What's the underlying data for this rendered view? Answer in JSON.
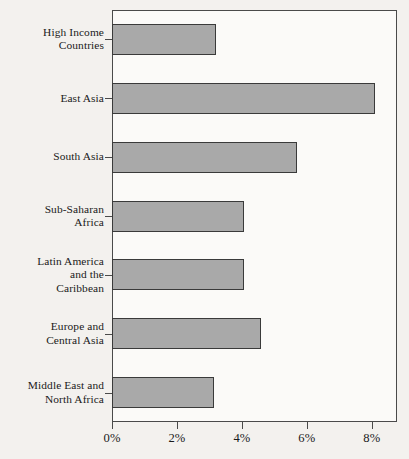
{
  "chart_data": {
    "type": "bar",
    "orientation": "horizontal",
    "title": "",
    "subtitle": "",
    "xlabel": "",
    "ylabel": "",
    "categories": [
      "High Income\nCountries",
      "East Asia",
      "South Asia",
      "Sub-Saharan\nAfrica",
      "Latin America\nand the\nCaribbean",
      "Europe and\nCentral Asia",
      "Middle East and\nNorth Africa"
    ],
    "values": [
      3.2,
      8.1,
      5.7,
      4.05,
      4.05,
      4.6,
      3.15
    ],
    "value_suffix": "%",
    "xlim": [
      0,
      8.77
    ],
    "ylim": [
      0,
      7
    ],
    "xticks": [
      0,
      2,
      4,
      6,
      8
    ],
    "xtick_labels": [
      "0%",
      "2%",
      "4%",
      "6%",
      "8%"
    ],
    "grid": false,
    "legend": null,
    "bar_color": "#a9a9a9",
    "bar_edge_color": "#3a3a3a",
    "axis_color": "#4a4a4a",
    "background_color": "#f3f1ee",
    "plot_background_color": "#fbfaf8",
    "text_color": "#1a1a1a"
  }
}
